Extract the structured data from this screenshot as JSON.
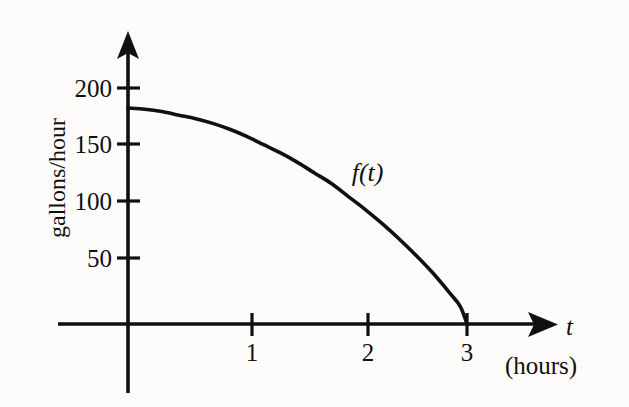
{
  "figure": {
    "background_color": "#fdfcfa",
    "ink_color": "#111010"
  },
  "chart_data": {
    "type": "line",
    "title": "",
    "subtitle": "",
    "xlabel": "t",
    "xlabel_units": "(hours)",
    "ylabel": "gallons/hour",
    "xlim": [
      0,
      3.8
    ],
    "ylim": [
      0,
      215
    ],
    "grid": false,
    "legend": "none",
    "annotations": [
      {
        "text": "f(t)",
        "x": 2.12,
        "y": 128
      }
    ],
    "xticks": [
      1,
      2,
      3
    ],
    "xtick_labels": [
      "1",
      "2",
      "3"
    ],
    "yticks": [
      50,
      100,
      150,
      200
    ],
    "ytick_labels": [
      "50",
      "100",
      "150",
      "200"
    ],
    "series": [
      {
        "name": "f(t)",
        "x": [
          0.0,
          0.15,
          0.3,
          0.45,
          0.6,
          0.75,
          0.9,
          1.05,
          1.2,
          1.35,
          1.5,
          1.65,
          1.8,
          1.95,
          2.1,
          2.25,
          2.4,
          2.55,
          2.7,
          2.85,
          2.94,
          3.0
        ],
        "y": [
          183,
          182,
          180,
          177,
          174,
          170,
          165,
          159,
          152,
          145,
          137,
          128,
          119,
          108,
          97,
          85,
          72,
          58,
          43,
          26,
          15,
          0
        ]
      }
    ],
    "key_points": [
      {
        "t": 0,
        "value": 183
      },
      {
        "t": 1,
        "value": 156
      },
      {
        "t": 2,
        "value": 94
      },
      {
        "t": 3,
        "value": 0
      }
    ]
  },
  "axes": {
    "y_axis_arrow": "up-arrow-icon",
    "x_axis_arrow": "right-arrow-icon"
  }
}
